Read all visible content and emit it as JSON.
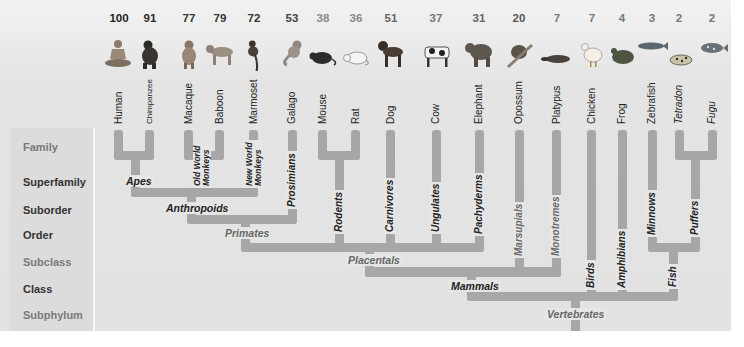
{
  "diagram": {
    "type": "phylogenetic-tree",
    "colors": {
      "branch": "#a7a7a7",
      "panel": "#e4e4e4",
      "left_column": "#dcdcdc"
    },
    "ranks": [
      {
        "label": "Family",
        "style": "light"
      },
      {
        "label": "Superfamily",
        "style": "dark"
      },
      {
        "label": "Suborder",
        "style": "dark"
      },
      {
        "label": "Order",
        "style": "dark"
      },
      {
        "label": "Subclass",
        "style": "light"
      },
      {
        "label": "Class",
        "style": "dark"
      },
      {
        "label": "Subphylum",
        "style": "light"
      }
    ],
    "species": [
      {
        "name": "Human",
        "value": "100",
        "icon": "human-icon"
      },
      {
        "name": "Chimpanzee",
        "value": "91",
        "icon": "chimpanzee-icon"
      },
      {
        "name": "Macaque",
        "value": "77",
        "icon": "macaque-icon"
      },
      {
        "name": "Baboon",
        "value": "79",
        "icon": "baboon-icon"
      },
      {
        "name": "Marmoset",
        "value": "72",
        "icon": "marmoset-icon"
      },
      {
        "name": "Galago",
        "value": "53",
        "icon": "galago-icon"
      },
      {
        "name": "Mouse",
        "value": "38",
        "icon": "mouse-icon"
      },
      {
        "name": "Rat",
        "value": "36",
        "icon": "rat-icon"
      },
      {
        "name": "Dog",
        "value": "51",
        "icon": "dog-icon"
      },
      {
        "name": "Cow",
        "value": "37",
        "icon": "cow-icon"
      },
      {
        "name": "Elephant",
        "value": "31",
        "icon": "elephant-icon"
      },
      {
        "name": "Opossum",
        "value": "20",
        "icon": "opossum-icon"
      },
      {
        "name": "Platypus",
        "value": "7",
        "icon": "platypus-icon"
      },
      {
        "name": "Chicken",
        "value": "7",
        "icon": "chicken-icon"
      },
      {
        "name": "Frog",
        "value": "4",
        "icon": "frog-icon"
      },
      {
        "name": "Zebrafish",
        "value": "3",
        "icon": "zebrafish-icon"
      },
      {
        "name": "Tetradon",
        "value": "2",
        "icon": "tetradon-icon"
      },
      {
        "name": "Fugu",
        "value": "2",
        "icon": "fugu-icon"
      }
    ],
    "clades": {
      "apes": "Apes",
      "old_world_1": "Old World",
      "old_world_2": "Monkeys",
      "new_world_1": "New World",
      "new_world_2": "Monkeys",
      "anthropoids": "Anthropoids",
      "prosimians": "Prosimians",
      "primates": "Primates",
      "rodents": "Rodents",
      "carnivores": "Carnivores",
      "ungulates": "Ungulates",
      "pachyderms": "Pachyderms",
      "placentals": "Placentals",
      "marsupials": "Marsupials",
      "monotremes": "Monotremes",
      "mammals": "Mammals",
      "birds": "Birds",
      "amphibians": "Amphibians",
      "minnows": "Minnows",
      "puffers": "Puffers",
      "fish": "Fish",
      "vertebrates": "Vertebrates"
    }
  }
}
